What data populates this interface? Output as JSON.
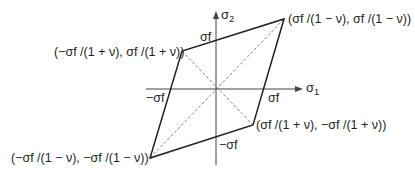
{
  "diagram": {
    "type": "failure-envelope",
    "colors": {
      "line": "#231f20",
      "dashed": "#555555",
      "axis": "#444444"
    },
    "axes": {
      "x_label": "σ",
      "x_label_sub": "1",
      "y_label": "σ",
      "y_label_sub": "2"
    },
    "intercepts": {
      "pos_x": "σf",
      "neg_x": "−σf",
      "pos_y": "σf",
      "neg_y": "−σf"
    },
    "vertices": {
      "top_right": "(σf /(1 − ν), σf /(1 − ν))",
      "upper_left": "(−σf /(1 + ν), σf /(1 + ν))",
      "lower_right": "(σf /(1 + ν), −σf /(1 + ν))",
      "bottom_left": "(−σf /(1 − ν), −σf /(1 − ν))"
    },
    "points_px": {
      "origin": [
        216,
        89
      ],
      "top_right": [
        284,
        19
      ],
      "upper_left": [
        182,
        51
      ],
      "lower_right": [
        253,
        125
      ],
      "bottom_left": [
        150,
        158
      ]
    }
  }
}
